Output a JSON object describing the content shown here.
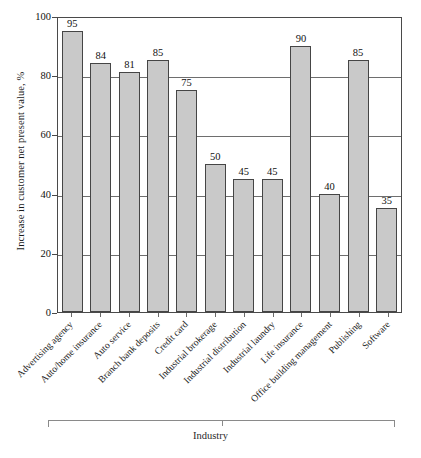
{
  "chart_data": {
    "type": "bar",
    "title": "",
    "subtitle": "",
    "xlabel": "Industry",
    "ylabel": "Increase in customer net present value, %",
    "ylim": [
      0,
      100
    ],
    "yticks": [
      0,
      20,
      40,
      60,
      80,
      100
    ],
    "ytick_labels": [
      "0",
      "20",
      "40",
      "60",
      "80",
      "100"
    ],
    "grid": true,
    "grid_axis": "y",
    "legend": false,
    "legend_position": "none",
    "bar_fill_color": "#c9c9c9",
    "bar_edge_color": "#454545",
    "value_labels_shown": true,
    "categories": [
      "Advertising agency",
      "Auto/home insurance",
      "Auto service",
      "Branch bank deposits",
      "Credit card",
      "Industrial brokerage",
      "Industrial distribution",
      "Industrial laundry",
      "Life insurance",
      "Office building management",
      "Publishing",
      "Software"
    ],
    "values": [
      95,
      84,
      81,
      85,
      75,
      50,
      45,
      45,
      90,
      40,
      85,
      35
    ],
    "value_label_strings": [
      "95",
      "84",
      "81",
      "85",
      "75",
      "50",
      "45",
      "45",
      "90",
      "40",
      "85",
      "35"
    ]
  }
}
